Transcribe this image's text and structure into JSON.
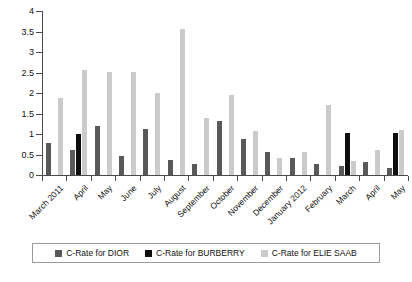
{
  "chart_data": {
    "type": "bar",
    "title": "",
    "subtitle": "",
    "xlabel": "",
    "ylabel": "",
    "ylim": [
      0,
      4
    ],
    "yticks": [
      "0",
      "0.5",
      "1",
      "1.5",
      "2",
      "2.5",
      "3",
      "3.5",
      "4"
    ],
    "ytick_values": [
      0,
      0.5,
      1,
      1.5,
      2,
      2.5,
      3,
      3.5,
      4
    ],
    "grid": false,
    "legend_position": "bottom",
    "categories": [
      "March 2011",
      "April",
      "May",
      "June",
      "July",
      "August",
      "September",
      "October",
      "November",
      "December",
      "January 2012",
      "February",
      "March",
      "April",
      "May"
    ],
    "series": [
      {
        "name": "C-Rate for DIOR",
        "color": "#595959",
        "values": [
          0.78,
          0.62,
          1.2,
          0.47,
          1.12,
          0.37,
          0.26,
          1.31,
          0.87,
          0.57,
          0.42,
          0.28,
          0.23,
          0.32,
          0.18
        ]
      },
      {
        "name": "C-Rate for BURBERRY",
        "color": "#0d0d0d",
        "values": [
          0.0,
          1.0,
          0.0,
          0.0,
          0.0,
          0.0,
          0.0,
          0.0,
          0.0,
          0.0,
          0.0,
          0.0,
          1.03,
          0.0,
          1.02
        ]
      },
      {
        "name": "C-Rate for ELIE SAAB",
        "color": "#cbcbcb",
        "values": [
          1.88,
          2.55,
          2.52,
          2.52,
          2.0,
          3.55,
          1.4,
          1.95,
          1.07,
          0.42,
          0.55,
          1.7,
          0.35,
          0.62,
          1.1
        ]
      }
    ],
    "legend": [
      {
        "label": "C-Rate for DIOR",
        "color": "#595959",
        "swatch": "square-swatch"
      },
      {
        "label": "C-Rate for BURBERRY",
        "color": "#0d0d0d",
        "swatch": "square-swatch"
      },
      {
        "label": "C-Rate for ELIE SAAB",
        "color": "#cbcbcb",
        "swatch": "square-swatch"
      }
    ]
  }
}
